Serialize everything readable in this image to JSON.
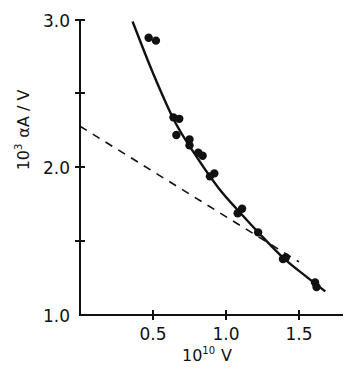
{
  "chart_data": {
    "type": "scatter",
    "title": "",
    "xlabel": "10¹⁰ V",
    "ylabel": "10³ αA / V",
    "xlim": [
      0,
      1.8
    ],
    "ylim": [
      1.0,
      3.0
    ],
    "x_ticks": [
      0.5,
      1.0,
      1.5
    ],
    "x_tick_labels": [
      "0.5",
      "1.0",
      "1.5"
    ],
    "y_ticks": [
      1.0,
      1.5,
      2.0,
      2.5,
      3.0
    ],
    "y_tick_labels": [
      "1.0",
      "",
      "2.0",
      "",
      "3.0"
    ],
    "grid": false,
    "legend": null,
    "series": [
      {
        "name": "measured points",
        "style": "markers",
        "x": [
          0.47,
          0.52,
          0.64,
          0.68,
          0.66,
          0.75,
          0.75,
          0.81,
          0.84,
          0.89,
          0.92,
          1.08,
          1.11,
          1.22,
          1.39,
          1.41,
          1.61,
          1.62
        ],
        "y": [
          2.88,
          2.86,
          2.34,
          2.33,
          2.22,
          2.19,
          2.15,
          2.1,
          2.08,
          1.94,
          1.96,
          1.69,
          1.72,
          1.56,
          1.38,
          1.39,
          1.22,
          1.19
        ]
      },
      {
        "name": "fitted curve",
        "style": "solid-line",
        "x": [
          0.36,
          0.5,
          0.65,
          0.8,
          0.95,
          1.1,
          1.25,
          1.4,
          1.55,
          1.68
        ],
        "y": [
          2.99,
          2.64,
          2.31,
          2.07,
          1.86,
          1.69,
          1.53,
          1.38,
          1.26,
          1.16
        ]
      },
      {
        "name": "linear asymptote",
        "style": "dashed-line",
        "x": [
          0.0,
          1.5
        ],
        "y": [
          2.28,
          1.36
        ]
      }
    ]
  },
  "labels": {
    "y_tick_1": "1.0",
    "y_tick_2": "2.0",
    "y_tick_3": "3.0",
    "x_tick_05": "0.5",
    "x_tick_10": "1.0",
    "x_tick_15": "1.5",
    "x_axis_base": "10",
    "x_axis_exp": "10",
    "x_axis_var": "V",
    "y_axis_base": "10",
    "y_axis_exp": "3",
    "y_axis_rest": "αA / V"
  }
}
